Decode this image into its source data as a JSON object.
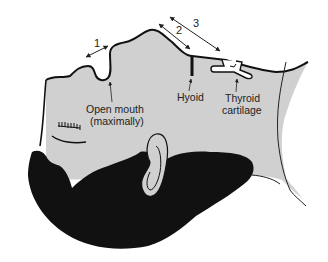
{
  "figure": {
    "colors": {
      "skin": "#d0d0d0",
      "hair": "#111111",
      "outline": "#111111",
      "background": "#ffffff"
    },
    "measurements": [
      {
        "id": "1",
        "label": "1"
      },
      {
        "id": "2",
        "label": "2"
      },
      {
        "id": "3",
        "label": "3"
      }
    ],
    "annotations": {
      "open_mouth_line1": "Open mouth",
      "open_mouth_line2": "(maximally)",
      "hyoid": "Hyoid",
      "thyroid_line1": "Thyroid",
      "thyroid_line2": "cartilage"
    }
  }
}
